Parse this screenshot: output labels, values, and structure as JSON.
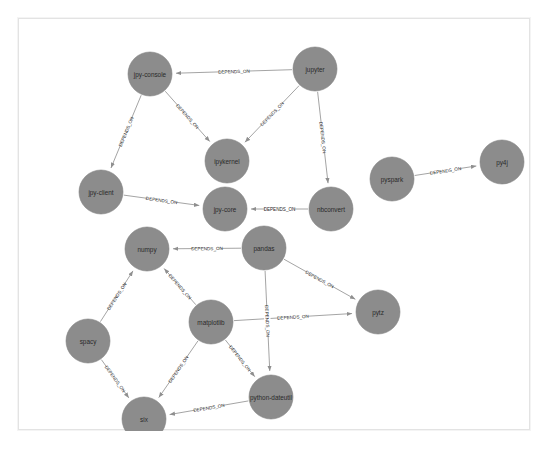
{
  "graph": {
    "title": "Package dependency graph",
    "relationship_label": "DEPENDS_ON",
    "node_fill": "#8c8c8c",
    "edge_color": "#9a9a9a",
    "label_color": "#2a2a2a",
    "background": "#ffffff",
    "frame_border": "#e3e3e3",
    "node_radius": 22,
    "nodes": [
      {
        "id": "jpy-console",
        "label": "jpy-console",
        "x": 131,
        "y": 55,
        "r": 22
      },
      {
        "id": "jupyter",
        "label": "jupyter",
        "x": 296,
        "y": 50,
        "r": 22
      },
      {
        "id": "ipykernel",
        "label": "ipykernel",
        "x": 208,
        "y": 142,
        "r": 22
      },
      {
        "id": "jpy-client",
        "label": "jpy-client",
        "x": 82,
        "y": 173,
        "r": 22
      },
      {
        "id": "jpy-core",
        "label": "jpy-core",
        "x": 206,
        "y": 190,
        "r": 22
      },
      {
        "id": "nbconvert",
        "label": "nbconvert",
        "x": 312,
        "y": 190,
        "r": 22
      },
      {
        "id": "pyspark",
        "label": "pyspark",
        "x": 373,
        "y": 160,
        "r": 22
      },
      {
        "id": "py4j",
        "label": "py4j",
        "x": 483,
        "y": 143,
        "r": 22
      },
      {
        "id": "numpy",
        "label": "numpy",
        "x": 128,
        "y": 230,
        "r": 22
      },
      {
        "id": "pandas",
        "label": "pandas",
        "x": 245,
        "y": 229,
        "r": 22
      },
      {
        "id": "matplotlib",
        "label": "matplotlib",
        "x": 192,
        "y": 303,
        "r": 22
      },
      {
        "id": "pytz",
        "label": "pytz",
        "x": 359,
        "y": 293,
        "r": 22
      },
      {
        "id": "spacy",
        "label": "spacy",
        "x": 69,
        "y": 322,
        "r": 22
      },
      {
        "id": "python-dateutil",
        "label": "python-dateutil",
        "x": 252,
        "y": 378,
        "r": 22
      },
      {
        "id": "six",
        "label": "six",
        "x": 125,
        "y": 400,
        "r": 22
      }
    ],
    "edges": [
      {
        "source": "jupyter",
        "target": "jpy-console",
        "label": "DEPENDS_ON"
      },
      {
        "source": "jpy-console",
        "target": "ipykernel",
        "label": "DEPENDS_ON"
      },
      {
        "source": "jupyter",
        "target": "ipykernel",
        "label": "DEPENDS_ON"
      },
      {
        "source": "jupyter",
        "target": "nbconvert",
        "label": "DEPENDS_ON"
      },
      {
        "source": "jpy-console",
        "target": "jpy-client",
        "label": "DEPENDS_ON"
      },
      {
        "source": "jpy-client",
        "target": "jpy-core",
        "label": "DEPENDS_ON"
      },
      {
        "source": "nbconvert",
        "target": "jpy-core",
        "label": "DEPENDS_ON"
      },
      {
        "source": "pyspark",
        "target": "py4j",
        "label": "DEPENDS_ON"
      },
      {
        "source": "pandas",
        "target": "numpy",
        "label": "DEPENDS_ON"
      },
      {
        "source": "matplotlib",
        "target": "numpy",
        "label": "DEPENDS_ON"
      },
      {
        "source": "spacy",
        "target": "numpy",
        "label": "DEPENDS_ON"
      },
      {
        "source": "pandas",
        "target": "pytz",
        "label": "DEPENDS_ON"
      },
      {
        "source": "matplotlib",
        "target": "pytz",
        "label": "DEPENDS_ON"
      },
      {
        "source": "pandas",
        "target": "python-dateutil",
        "label": "DEPENDS_ON"
      },
      {
        "source": "matplotlib",
        "target": "python-dateutil",
        "label": "DEPENDS_ON"
      },
      {
        "source": "matplotlib",
        "target": "six",
        "label": "DEPENDS_ON"
      },
      {
        "source": "spacy",
        "target": "six",
        "label": "DEPENDS_ON"
      },
      {
        "source": "python-dateutil",
        "target": "six",
        "label": "DEPENDS_ON"
      }
    ]
  }
}
